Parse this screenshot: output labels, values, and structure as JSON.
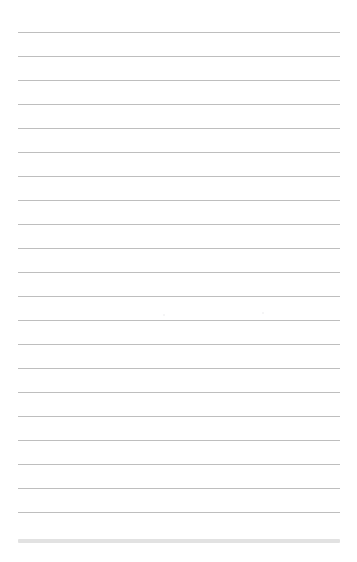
{
  "page": {
    "kind": "scanned-lined-paper",
    "width": 357,
    "height": 562,
    "background_color": "#ffffff",
    "content_text": "",
    "has_handwriting": false,
    "has_printed_text": false
  },
  "rules": {
    "count": 21,
    "color": "#9a9a9a",
    "thickness_px": 1,
    "left_x": 18,
    "right_x": 340,
    "line_length_px": 322,
    "first_line_y": 32,
    "line_spacing_px": 24,
    "last_line_y": 512,
    "y_positions": [
      32,
      56,
      80,
      104,
      128,
      152,
      176,
      200,
      224,
      248,
      272,
      296,
      320,
      344,
      368,
      392,
      416,
      440,
      464,
      488,
      512
    ]
  },
  "footer_band": {
    "color": "#e2e2e2",
    "thickness_px": 4,
    "left_x": 18,
    "right_x": 340,
    "y": 539
  },
  "margins": {
    "top_px": 32,
    "bottom_px": 19,
    "left_px": 18,
    "right_px": 17,
    "vertical_margin_rule": false
  },
  "artifacts": {
    "specks": [
      {
        "x": 163,
        "y": 314,
        "size": 2
      },
      {
        "x": 262,
        "y": 312,
        "size": 2
      }
    ]
  }
}
